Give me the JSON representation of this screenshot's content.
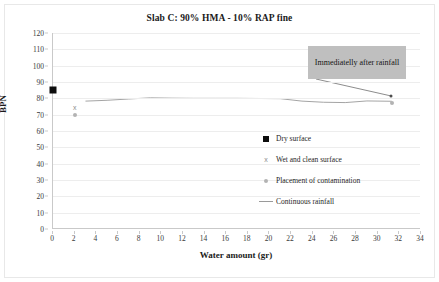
{
  "chart_data": {
    "type": "line",
    "title": "Slab C: 90% HMA - 10% RAP fine",
    "xlabel": "Water amount (gr)",
    "ylabel": "BPN",
    "xlim": [
      0,
      34
    ],
    "ylim": [
      0,
      120
    ],
    "xticks": [
      0,
      2,
      4,
      6,
      8,
      10,
      12,
      14,
      16,
      18,
      20,
      22,
      24,
      26,
      28,
      30,
      32,
      34
    ],
    "yticks": [
      0,
      10,
      20,
      30,
      40,
      50,
      60,
      70,
      80,
      90,
      100,
      110,
      120
    ],
    "grid": "horizontal",
    "legend_position": "inside-right",
    "series": [
      {
        "name": "Dry surface",
        "marker": "filled-square",
        "color": "#0d0d0d",
        "points": [
          {
            "x": 0,
            "y": 85
          }
        ]
      },
      {
        "name": "Wet and clean surface",
        "marker": "x",
        "color": "#8c8c8c",
        "points": [
          {
            "x": 2,
            "y": 75
          }
        ]
      },
      {
        "name": "Placement of contamination",
        "marker": "dot",
        "color": "#b3b3b3",
        "points": [
          {
            "x": 2,
            "y": 69.5
          },
          {
            "x": 31.3,
            "y": 77
          }
        ]
      },
      {
        "name": "Continuous rainfall",
        "marker": "line",
        "color": "#9a9a9a",
        "points": [
          {
            "x": 3.0,
            "y": 78.3
          },
          {
            "x": 5.0,
            "y": 78.8
          },
          {
            "x": 7.0,
            "y": 79.6
          },
          {
            "x": 9.0,
            "y": 80.3
          },
          {
            "x": 11.0,
            "y": 80.1
          },
          {
            "x": 13.0,
            "y": 80.0
          },
          {
            "x": 15.0,
            "y": 80.0
          },
          {
            "x": 17.0,
            "y": 80.0
          },
          {
            "x": 19.0,
            "y": 79.9
          },
          {
            "x": 21.0,
            "y": 79.8
          },
          {
            "x": 23.0,
            "y": 78.3
          },
          {
            "x": 25.0,
            "y": 77.6
          },
          {
            "x": 27.0,
            "y": 77.4
          },
          {
            "x": 29.0,
            "y": 78.4
          },
          {
            "x": 31.3,
            "y": 78.2
          }
        ]
      }
    ],
    "annotations": [
      {
        "text": "Immediatelly after rainfall",
        "target": {
          "x": 31.2,
          "y": 81.5
        },
        "style": "grey-box-with-leader"
      }
    ]
  },
  "legend": {
    "items": [
      {
        "label": "Dry surface",
        "marker": "filled-square"
      },
      {
        "label": "Wet and clean surface",
        "marker": "x"
      },
      {
        "label": "Placement of contamination",
        "marker": "dot"
      },
      {
        "label": "Continuous rainfall",
        "marker": "line"
      }
    ]
  }
}
